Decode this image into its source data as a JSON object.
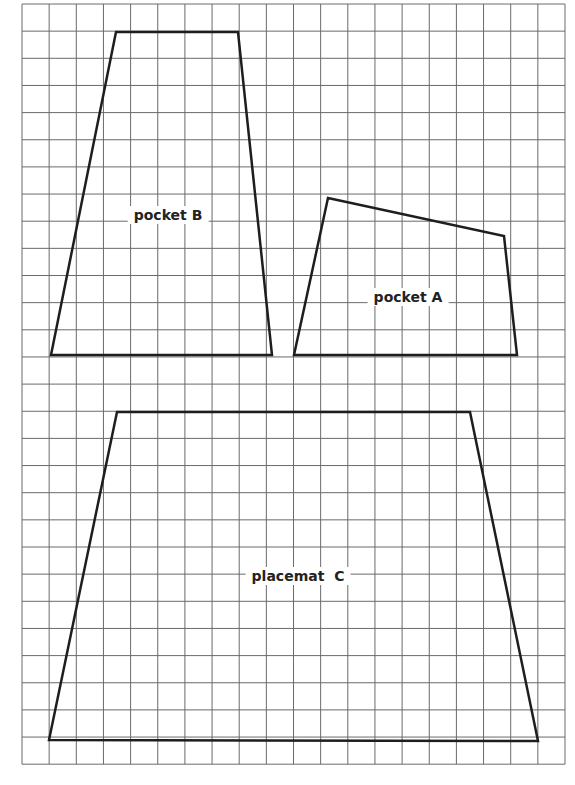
{
  "figure": {
    "type": "pattern-layout-on-grid",
    "grid": {
      "left": 22,
      "top": 4,
      "cell": 27.15,
      "columns": 20,
      "rows": 28,
      "line_color": "#6a6a6a"
    },
    "outline_color": "#1e1e1e",
    "shapes": [
      {
        "id": "pocket-b",
        "label": "pocket B",
        "label_pos": [
          168,
          215
        ],
        "points": [
          [
            116,
            32
          ],
          [
            238,
            32
          ],
          [
            272,
            355
          ],
          [
            51,
            355
          ]
        ]
      },
      {
        "id": "pocket-a",
        "label": "pocket A",
        "label_pos": [
          408,
          297
        ],
        "points": [
          [
            328,
            198
          ],
          [
            504,
            236
          ],
          [
            517,
            355
          ],
          [
            294,
            355
          ]
        ]
      },
      {
        "id": "placemat-c",
        "label": "placemat  C",
        "label_pos": [
          298,
          576
        ],
        "points": [
          [
            117,
            412
          ],
          [
            470,
            412
          ],
          [
            538,
            741
          ],
          [
            49,
            740
          ]
        ]
      }
    ]
  }
}
